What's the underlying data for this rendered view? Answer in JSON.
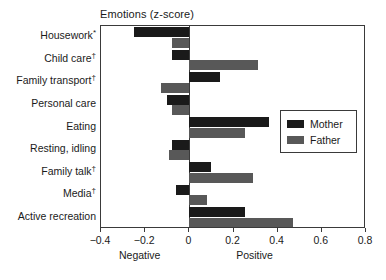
{
  "chart_data": {
    "type": "bar",
    "orientation": "horizontal",
    "title": "Emotions (z-score)",
    "xlabel": "",
    "ylabel": "",
    "xlim": [
      -0.4,
      0.8
    ],
    "xticks": [
      -0.4,
      -0.2,
      0,
      0.2,
      0.4,
      0.6,
      0.8
    ],
    "xtick_labels": [
      "−0.4",
      "−0.2",
      "0",
      "0.2",
      "0.4",
      "0.6",
      "0.8"
    ],
    "axis_low_label": "Negative",
    "axis_high_label": "Positive",
    "grid": false,
    "legend_position": "center-right",
    "categories": [
      "Housework",
      "Child care",
      "Family transport",
      "Personal care",
      "Eating",
      "Resting, idling",
      "Family talk",
      "Media",
      "Active recreation"
    ],
    "category_marks": [
      "*",
      "†",
      "†",
      "",
      "",
      "",
      "†",
      "†",
      ""
    ],
    "series": [
      {
        "name": "Mother",
        "color": "#1a1a1a",
        "values": [
          -0.25,
          -0.08,
          0.14,
          -0.1,
          0.36,
          -0.08,
          0.1,
          -0.06,
          0.25
        ]
      },
      {
        "name": "Father",
        "color": "#585858",
        "values": [
          -0.08,
          0.31,
          -0.13,
          -0.08,
          0.25,
          -0.09,
          0.29,
          0.08,
          0.47
        ]
      }
    ]
  },
  "legend": {
    "items": [
      {
        "label": "Mother",
        "swatch": "mother"
      },
      {
        "label": "Father",
        "swatch": "father"
      }
    ]
  }
}
